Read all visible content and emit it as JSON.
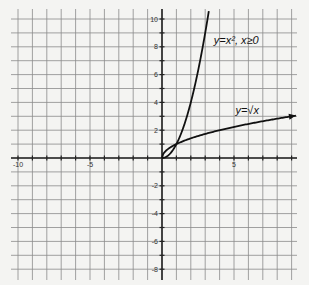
{
  "chart_data": {
    "type": "line",
    "title": "",
    "xlabel": "",
    "ylabel": "",
    "xlim": [
      -10.5,
      9.4
    ],
    "ylim": [
      -8.8,
      10.4
    ],
    "grid": true,
    "x_ticks": [
      {
        "value": -10,
        "label": "-10"
      },
      {
        "value": -5,
        "label": "-5"
      },
      {
        "value": 5,
        "label": "5"
      }
    ],
    "y_ticks": [
      {
        "value": 10,
        "label": "10"
      },
      {
        "value": 8,
        "label": "8"
      },
      {
        "value": 6,
        "label": "6"
      },
      {
        "value": 4,
        "label": "4"
      },
      {
        "value": 2,
        "label": "2"
      },
      {
        "value": -2,
        "label": "-2"
      },
      {
        "value": -4,
        "label": "-4"
      },
      {
        "value": -6,
        "label": "-6"
      },
      {
        "value": -8,
        "label": "-8"
      }
    ],
    "series": [
      {
        "name": "y=x², x≥0",
        "function": "x^2",
        "domain": [
          0,
          3.25
        ],
        "label": "y=x², x≥0",
        "label_pos": [
          3.6,
          8.2
        ]
      },
      {
        "name": "y=√x",
        "function": "sqrt(x)",
        "domain": [
          0,
          9.3
        ],
        "label": "y=√x",
        "label_pos": [
          5.1,
          3.2
        ],
        "arrow": true
      }
    ]
  },
  "labels": {
    "parabola": "y=x², x≥0",
    "sqrt": "y=√x"
  },
  "colors": {
    "grid": "#8a8a8a",
    "axis": "#222222",
    "curve": "#111111",
    "background": "#f4f4f2"
  }
}
